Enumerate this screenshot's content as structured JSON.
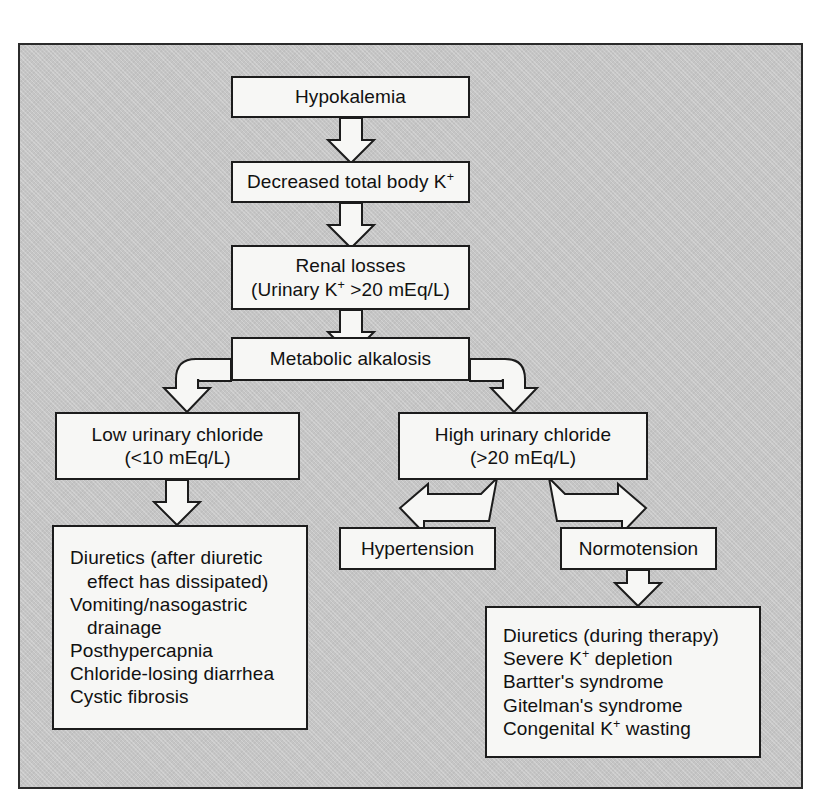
{
  "figure": {
    "background_color": "#c5c5c5",
    "box_fill_color": "#f7f7f5",
    "line_color": "#1c1c1c"
  },
  "nodes": {
    "hypokalemia": {
      "name": "Hypokalemia",
      "lines": [
        "Hypokalemia"
      ]
    },
    "decreased_total_body_k": {
      "name": "Decreased total body K+",
      "lines": [
        "Decreased total body K"
      ],
      "superscript": "+"
    },
    "renal_losses": {
      "name": "Renal losses",
      "line1": "Renal losses",
      "line2_pre": "(Urinary K",
      "line2_sup": "+",
      "line2_post": " >20 mEq/L)"
    },
    "metabolic_alkalosis": {
      "name": "Metabolic alkalosis",
      "lines": [
        "Metabolic alkalosis"
      ]
    },
    "low_urinary_chloride": {
      "name": "Low urinary chloride",
      "line1": "Low urinary chloride",
      "line2": "(<10 mEq/L)"
    },
    "high_urinary_chloride": {
      "name": "High urinary chloride",
      "line1": "High urinary chloride",
      "line2": "(>20 mEq/L)"
    },
    "hypertension": {
      "name": "Hypertension",
      "lines": [
        "Hypertension"
      ]
    },
    "normotension": {
      "name": "Normotension",
      "lines": [
        "Normotension"
      ]
    },
    "low_chloride_causes": {
      "name": "Low urinary chloride causes",
      "items": [
        {
          "text": "Diuretics (after diuretic",
          "continuation": false
        },
        {
          "text": "effect has dissipated)",
          "continuation": true
        },
        {
          "text": "Vomiting/nasogastric",
          "continuation": false
        },
        {
          "text": "drainage",
          "continuation": true
        },
        {
          "text": "Posthypercapnia",
          "continuation": false
        },
        {
          "text": "Chloride-losing diarrhea",
          "continuation": false
        },
        {
          "text": "Cystic fibrosis",
          "continuation": false
        }
      ]
    },
    "normotension_causes": {
      "name": "Normotension causes",
      "items": [
        {
          "pre": "Diuretics (during therapy)",
          "sup": "",
          "post": ""
        },
        {
          "pre": "Severe K",
          "sup": "+",
          "post": " depletion"
        },
        {
          "pre": "Bartter's syndrome",
          "sup": "",
          "post": ""
        },
        {
          "pre": "Gitelman's syndrome",
          "sup": "",
          "post": ""
        },
        {
          "pre": "Congenital K",
          "sup": "+",
          "post": " wasting"
        }
      ]
    }
  },
  "flow": {
    "edges": [
      {
        "from": "Hypokalemia",
        "to": "Decreased total body K+",
        "style": "hollow-down-arrow"
      },
      {
        "from": "Decreased total body K+",
        "to": "Renal losses",
        "style": "hollow-down-arrow"
      },
      {
        "from": "Renal losses",
        "to": "Metabolic alkalosis",
        "style": "hollow-down-arrow"
      },
      {
        "from": "Metabolic alkalosis",
        "to": "Low urinary chloride",
        "style": "hollow-elbow-left"
      },
      {
        "from": "Metabolic alkalosis",
        "to": "High urinary chloride",
        "style": "hollow-elbow-right"
      },
      {
        "from": "Low urinary chloride",
        "to": "Low urinary chloride causes",
        "style": "hollow-down-arrow"
      },
      {
        "from": "High urinary chloride",
        "to": "Hypertension",
        "style": "hollow-diagonal-left"
      },
      {
        "from": "High urinary chloride",
        "to": "Normotension",
        "style": "hollow-diagonal-right"
      },
      {
        "from": "Normotension",
        "to": "Normotension causes",
        "style": "hollow-down-arrow"
      }
    ]
  }
}
